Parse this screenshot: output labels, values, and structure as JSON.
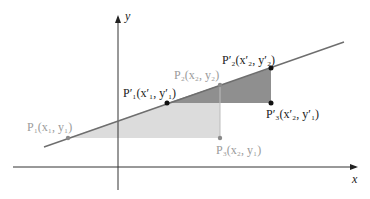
{
  "diagram": {
    "type": "coordinate-geometry",
    "colors": {
      "axis": "#333333",
      "line": "#6e6e6e",
      "triangle_light": "#d9d9d9",
      "triangle_dark": "#8c8c8c",
      "point_dark": "#111111",
      "point_gray": "#8a8a8a",
      "label_dark": "#1a1a1a",
      "label_gray": "#9a9a9a"
    },
    "axes": {
      "x_label": "x",
      "y_label": "y"
    },
    "points": [
      {
        "id": "P1",
        "label": "P₁(x₁, y₁)",
        "style": "gray"
      },
      {
        "id": "P2",
        "label": "P₂(x₂, y₂)",
        "style": "gray"
      },
      {
        "id": "P3",
        "label": "P₃(x₂, y₁)",
        "style": "gray"
      },
      {
        "id": "P1p",
        "label": "P′₁(x′₁, y′₁)",
        "style": "dark"
      },
      {
        "id": "P2p",
        "label": "P′₂(x′₂, y′₂)",
        "style": "dark"
      },
      {
        "id": "P3p",
        "label": "P′₃(x′₂, y′₁)",
        "style": "dark"
      }
    ]
  }
}
